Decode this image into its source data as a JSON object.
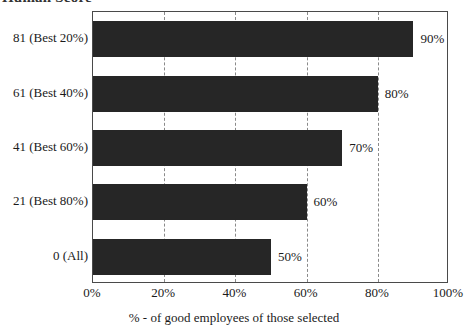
{
  "title_fragment": "Human Score",
  "chart_data": {
    "type": "bar",
    "orientation": "horizontal",
    "title": "",
    "xlabel": "% - of good employees of those selected",
    "ylabel": "",
    "categories": [
      "81 (Best 20%)",
      "61 (Best 40%)",
      "41 (Best 60%)",
      "21 (Best 80%)",
      "0 (All)"
    ],
    "values": [
      90,
      80,
      70,
      60,
      50
    ],
    "data_labels": [
      "90%",
      "80%",
      "70%",
      "60%",
      "50%"
    ],
    "xlim": [
      0,
      100
    ],
    "xticks": [
      0,
      20,
      40,
      60,
      80,
      100
    ],
    "xticklabels": [
      "0%",
      "20%",
      "40%",
      "60%",
      "80%",
      "100%"
    ],
    "gridlines": [
      20,
      40,
      60,
      80
    ],
    "grid": true,
    "grid_style": "dashed",
    "legend": false,
    "bar_color": "#262626",
    "grid_color": "#8a8a8a",
    "frame_color": "#4a4a4a",
    "background": "#ffffff"
  }
}
